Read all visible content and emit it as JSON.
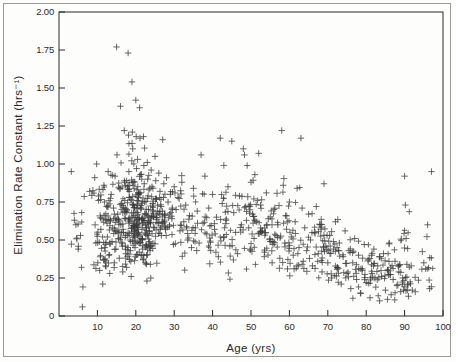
{
  "figure": {
    "background_color": "#fdfdfc",
    "border_color": "#9a9a96",
    "ink_color": "#2b2b2b"
  },
  "chart_data": {
    "type": "scatter",
    "title": "",
    "xlabel": "Age (yrs)",
    "ylabel": "Elimination Rate Constant (hrs⁻¹)",
    "xlim": [
      0,
      100
    ],
    "ylim": [
      0,
      2.0
    ],
    "xticks": [
      0,
      10,
      20,
      30,
      40,
      50,
      60,
      70,
      80,
      90,
      100
    ],
    "xtick_labels": [
      "",
      "10",
      "20",
      "30",
      "40",
      "50",
      "60",
      "70",
      "80",
      "90",
      "100"
    ],
    "yticks": [
      0,
      0.25,
      0.5,
      0.75,
      1.0,
      1.25,
      1.5,
      1.75,
      2.0
    ],
    "ytick_labels": [
      "0",
      "0.25",
      "0.50",
      "0.75",
      "1.00",
      "1.25",
      "1.50",
      "1.75",
      "2.00"
    ],
    "grid": false,
    "legend": null,
    "marker": "plus",
    "marker_color": "#3a3a3a",
    "marker_size": 3.2,
    "tick_direction": "in",
    "series": [
      {
        "name": "patients",
        "n_points": 980,
        "points": [
          [
            3.2,
            0.95
          ],
          [
            4.0,
            0.63
          ],
          [
            4.4,
            0.6
          ],
          [
            5.0,
            0.44
          ],
          [
            5.6,
            0.53
          ],
          [
            6.1,
            0.06
          ],
          [
            9.3,
            0.91
          ],
          [
            9.6,
            0.48
          ],
          [
            9.8,
            1.0
          ],
          [
            10.1,
            0.35
          ],
          [
            10.3,
            0.76
          ],
          [
            10.6,
            0.3
          ],
          [
            10.9,
            0.57
          ],
          [
            11.2,
            0.64
          ],
          [
            11.4,
            0.21
          ],
          [
            11.7,
            0.86
          ],
          [
            11.9,
            0.45
          ],
          [
            12.1,
            0.33
          ],
          [
            12.4,
            0.72
          ],
          [
            12.6,
            0.52
          ],
          [
            12.8,
            0.95
          ],
          [
            13.0,
            0.4
          ],
          [
            13.2,
            0.28
          ],
          [
            13.4,
            0.63
          ],
          [
            13.6,
            0.8
          ],
          [
            13.8,
            0.49
          ],
          [
            14.0,
            0.58
          ],
          [
            14.2,
            0.71
          ],
          [
            14.4,
            0.35
          ],
          [
            14.6,
            0.92
          ],
          [
            14.8,
            0.44
          ],
          [
            15.0,
            1.77
          ],
          [
            15.1,
            1.06
          ],
          [
            15.3,
            0.67
          ],
          [
            15.5,
            0.51
          ],
          [
            15.7,
            0.38
          ],
          [
            15.9,
            0.84
          ],
          [
            16.0,
            1.38
          ],
          [
            16.1,
            0.6
          ],
          [
            16.3,
            0.74
          ],
          [
            16.5,
            0.46
          ],
          [
            16.6,
            0.29
          ],
          [
            16.8,
            0.55
          ],
          [
            17.0,
            1.22
          ],
          [
            17.1,
            0.88
          ],
          [
            17.3,
            0.64
          ],
          [
            17.4,
            0.41
          ],
          [
            17.6,
            0.32
          ],
          [
            17.7,
            0.7
          ],
          [
            17.9,
            0.53
          ],
          [
            18.0,
            1.73
          ],
          [
            18.1,
            1.19
          ],
          [
            18.2,
            0.95
          ],
          [
            18.3,
            0.78
          ],
          [
            18.4,
            0.62
          ],
          [
            18.5,
            0.5
          ],
          [
            18.6,
            0.43
          ],
          [
            18.7,
            0.36
          ],
          [
            18.8,
            0.26
          ],
          [
            18.9,
            0.58
          ],
          [
            19.0,
            1.54
          ],
          [
            19.1,
            1.21
          ],
          [
            19.2,
            1.1
          ],
          [
            19.3,
            0.86
          ],
          [
            19.4,
            0.73
          ],
          [
            19.5,
            0.66
          ],
          [
            19.6,
            0.59
          ],
          [
            19.7,
            0.52
          ],
          [
            19.8,
            0.45
          ],
          [
            19.9,
            0.39
          ],
          [
            20.0,
            1.42
          ],
          [
            20.1,
            1.18
          ],
          [
            20.2,
            0.97
          ],
          [
            20.3,
            0.83
          ],
          [
            20.4,
            0.76
          ],
          [
            20.5,
            0.68
          ],
          [
            20.6,
            0.61
          ],
          [
            20.7,
            0.55
          ],
          [
            20.8,
            0.48
          ],
          [
            20.9,
            0.42
          ],
          [
            21.0,
            1.37
          ],
          [
            21.1,
            1.17
          ],
          [
            21.2,
            0.93
          ],
          [
            21.3,
            0.81
          ],
          [
            21.4,
            0.71
          ],
          [
            21.5,
            0.64
          ],
          [
            21.6,
            0.57
          ],
          [
            21.7,
            0.5
          ],
          [
            21.8,
            0.44
          ],
          [
            21.9,
            0.37
          ],
          [
            22.0,
            1.18
          ],
          [
            22.1,
            0.99
          ],
          [
            22.2,
            0.87
          ],
          [
            22.3,
            0.75
          ],
          [
            22.4,
            0.67
          ],
          [
            22.5,
            0.6
          ],
          [
            22.6,
            0.54
          ],
          [
            22.7,
            0.47
          ],
          [
            22.8,
            0.4
          ],
          [
            22.9,
            0.23
          ],
          [
            23.0,
            1.01
          ],
          [
            23.1,
            0.9
          ],
          [
            23.2,
            0.79
          ],
          [
            23.3,
            0.7
          ],
          [
            23.4,
            0.63
          ],
          [
            23.5,
            0.56
          ],
          [
            23.6,
            0.49
          ],
          [
            23.7,
            0.43
          ],
          [
            23.8,
            0.34
          ],
          [
            23.9,
            0.25
          ],
          [
            24.0,
            0.96
          ],
          [
            24.2,
            0.85
          ],
          [
            24.4,
            0.74
          ],
          [
            24.6,
            0.65
          ],
          [
            24.8,
            0.58
          ],
          [
            25.0,
            1.05
          ],
          [
            25.2,
            0.89
          ],
          [
            25.4,
            0.77
          ],
          [
            25.6,
            0.69
          ],
          [
            25.8,
            0.61
          ],
          [
            26.0,
            0.94
          ],
          [
            26.3,
            0.82
          ],
          [
            26.6,
            0.72
          ],
          [
            26.9,
            0.62
          ],
          [
            27.0,
            1.16
          ],
          [
            27.3,
            0.87
          ],
          [
            27.6,
            0.66
          ],
          [
            27.9,
            0.53
          ],
          [
            28.0,
            0.91
          ],
          [
            28.4,
            0.75
          ],
          [
            28.8,
            0.59
          ],
          [
            29.0,
            0.8
          ],
          [
            29.4,
            0.64
          ],
          [
            29.8,
            0.47
          ],
          [
            30.0,
            0.85
          ],
          [
            30.5,
            0.7
          ],
          [
            31.0,
            0.78
          ],
          [
            31.5,
            0.56
          ],
          [
            32.0,
            0.88
          ],
          [
            32.5,
            0.62
          ],
          [
            33.0,
            0.73
          ],
          [
            33.5,
            0.5
          ],
          [
            34.0,
            0.66
          ],
          [
            34.5,
            0.45
          ],
          [
            35.0,
            0.84
          ],
          [
            35.5,
            0.58
          ],
          [
            36.0,
            0.69
          ],
          [
            36.5,
            0.48
          ],
          [
            37.0,
            1.06
          ],
          [
            37.5,
            0.61
          ],
          [
            38.0,
            0.92
          ],
          [
            38.5,
            0.54
          ],
          [
            39.0,
            0.71
          ],
          [
            39.5,
            0.43
          ],
          [
            40.0,
            0.8
          ],
          [
            40.5,
            0.57
          ],
          [
            41.0,
            0.65
          ],
          [
            41.5,
            0.39
          ],
          [
            42.0,
            1.17
          ],
          [
            42.5,
            0.74
          ],
          [
            43.0,
            0.52
          ],
          [
            43.5,
            0.63
          ],
          [
            44.0,
            0.85
          ],
          [
            44.5,
            0.46
          ],
          [
            45.0,
            1.15
          ],
          [
            45.5,
            0.68
          ],
          [
            46.0,
            0.55
          ],
          [
            46.5,
            0.41
          ],
          [
            47.0,
            0.79
          ],
          [
            47.5,
            0.6
          ],
          [
            48.0,
            1.1
          ],
          [
            48.3,
            1.06
          ],
          [
            48.6,
            0.72
          ],
          [
            49.0,
            0.99
          ],
          [
            49.4,
            0.58
          ],
          [
            49.8,
            0.44
          ],
          [
            50.0,
            0.88
          ],
          [
            50.4,
            0.67
          ],
          [
            50.8,
            0.51
          ],
          [
            51.0,
            0.93
          ],
          [
            51.5,
            0.62
          ],
          [
            52.0,
            1.07
          ],
          [
            52.5,
            0.73
          ],
          [
            53.0,
            0.56
          ],
          [
            53.5,
            0.42
          ],
          [
            54.0,
            0.81
          ],
          [
            54.5,
            0.64
          ],
          [
            55.0,
            0.49
          ],
          [
            55.5,
            0.35
          ],
          [
            56.0,
            0.7
          ],
          [
            56.5,
            0.53
          ],
          [
            57.0,
            0.6
          ],
          [
            57.5,
            0.38
          ],
          [
            58.0,
            1.22
          ],
          [
            58.4,
            0.86
          ],
          [
            58.8,
            0.48
          ],
          [
            59.0,
            0.66
          ],
          [
            59.5,
            0.31
          ],
          [
            60.0,
            0.75
          ],
          [
            60.5,
            0.52
          ],
          [
            61.0,
            0.4
          ],
          [
            61.5,
            0.62
          ],
          [
            62.0,
            0.84
          ],
          [
            62.5,
            0.45
          ],
          [
            63.0,
            1.17
          ],
          [
            63.3,
            0.71
          ],
          [
            63.6,
            0.36
          ],
          [
            64.0,
            0.58
          ],
          [
            64.5,
            0.43
          ],
          [
            65.0,
            0.67
          ],
          [
            65.5,
            0.5
          ],
          [
            66.0,
            0.33
          ],
          [
            66.5,
            0.55
          ],
          [
            67.0,
            0.72
          ],
          [
            67.5,
            0.41
          ],
          [
            68.0,
            0.6
          ],
          [
            68.5,
            0.29
          ],
          [
            69.0,
            0.87
          ],
          [
            69.5,
            0.46
          ],
          [
            70.0,
            0.35
          ],
          [
            70.5,
            0.53
          ],
          [
            71.0,
            0.25
          ],
          [
            71.5,
            0.44
          ],
          [
            72.0,
            0.62
          ],
          [
            72.5,
            0.32
          ],
          [
            73.0,
            0.48
          ],
          [
            73.5,
            0.21
          ],
          [
            74.0,
            0.39
          ],
          [
            74.5,
            0.56
          ],
          [
            75.0,
            0.28
          ],
          [
            75.5,
            0.43
          ],
          [
            76.0,
            0.18
          ],
          [
            76.5,
            0.35
          ],
          [
            77.0,
            0.51
          ],
          [
            77.5,
            0.24
          ],
          [
            78.0,
            0.4
          ],
          [
            78.5,
            0.15
          ],
          [
            79.0,
            0.31
          ],
          [
            79.5,
            0.47
          ],
          [
            80.0,
            0.22
          ],
          [
            80.5,
            0.37
          ],
          [
            81.0,
            0.12
          ],
          [
            81.5,
            0.28
          ],
          [
            82.0,
            0.44
          ],
          [
            82.5,
            0.19
          ],
          [
            83.0,
            0.33
          ],
          [
            83.5,
            0.1
          ],
          [
            84.0,
            0.26
          ],
          [
            84.5,
            0.41
          ],
          [
            85.0,
            0.17
          ],
          [
            85.5,
            0.3
          ],
          [
            86.0,
            0.48
          ],
          [
            86.5,
            0.14
          ],
          [
            87.0,
            0.24
          ],
          [
            87.5,
            0.36
          ],
          [
            88.0,
            0.2
          ],
          [
            88.5,
            0.29
          ],
          [
            89.0,
            0.16
          ],
          [
            89.5,
            0.25
          ],
          [
            90.0,
            0.92
          ],
          [
            90.2,
            0.73
          ],
          [
            90.4,
            0.51
          ],
          [
            90.6,
            0.34
          ],
          [
            90.8,
            0.21
          ],
          [
            91.0,
            0.13
          ],
          [
            92.0,
            0.17
          ],
          [
            95.0,
            0.35
          ],
          [
            95.5,
            0.31
          ],
          [
            96.0,
            0.6
          ],
          [
            97.0,
            0.95
          ],
          [
            96.5,
            0.18
          ]
        ]
      }
    ]
  },
  "axes": {
    "x_title": "Age (yrs)",
    "y_title": "Elimination Rate Constant (hrs⁻¹)"
  }
}
